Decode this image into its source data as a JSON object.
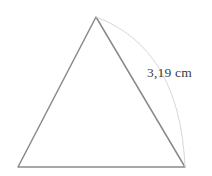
{
  "figure": {
    "type": "geometry-diagram",
    "background_color": "#ffffff",
    "width": 212,
    "height": 176,
    "triangle": {
      "name": "isosceles-triangle",
      "stroke_color": "#8a8a8a",
      "stroke_width": 1.5,
      "fill": "none",
      "vertices": {
        "apex": {
          "x": 96,
          "y": 17
        },
        "bottom_left": {
          "x": 18,
          "y": 167
        },
        "bottom_right": {
          "x": 185,
          "y": 167
        }
      },
      "points_attr": "96,17 18,167 185,167"
    },
    "arc": {
      "name": "measurement-arc",
      "stroke_color": "#d8d8d8",
      "stroke_width": 1,
      "fill": "none",
      "from": {
        "x": 96,
        "y": 17
      },
      "to": {
        "x": 185,
        "y": 167
      },
      "bulge_point": {
        "x": 170,
        "y": 96
      },
      "path_attr": "M 96 17 Q 180 48 185 167"
    },
    "label": {
      "name": "side-length-label",
      "text": "3,19 cm",
      "value": "3,19",
      "unit": "cm",
      "color": "#3c3c3c",
      "x": 147,
      "y": 65
    }
  }
}
